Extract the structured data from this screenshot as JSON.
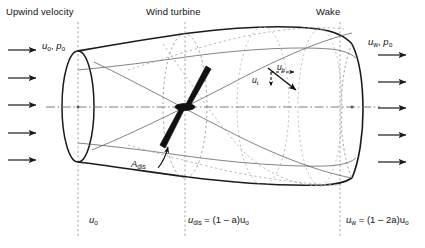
{
  "diagram": {
    "headers": [
      {
        "id": "upwind",
        "text": "Upwind velocity",
        "x": 6,
        "y": 6
      },
      {
        "id": "turbine",
        "text": "Wind turbine",
        "x": 146,
        "y": 6
      },
      {
        "id": "wake",
        "text": "Wake",
        "x": 316,
        "y": 6
      }
    ],
    "flow_labels": [
      {
        "id": "upstream-conditions",
        "u": "u",
        "usub": "o",
        "p": "p",
        "psub": "o",
        "x": 42,
        "y": 40
      },
      {
        "id": "wake-conditions",
        "u": "u",
        "usub": "w",
        "p": "p",
        "psub": "o",
        "x": 368,
        "y": 36
      }
    ],
    "vector_labels": [
      {
        "id": "u-h",
        "symbol": "u",
        "sub": "h",
        "x": 277,
        "y": 62
      },
      {
        "id": "u-t",
        "symbol": "u",
        "sub": "t",
        "x": 252,
        "y": 75
      }
    ],
    "area_label": {
      "id": "a-dis",
      "symbol": "A",
      "sub": "dis",
      "x": 131,
      "y": 158
    },
    "station_labels": [
      {
        "id": "station-upwind",
        "text": "u",
        "sub": "o",
        "expr": "",
        "x": 89,
        "y": 214
      },
      {
        "id": "station-disc",
        "text": "u",
        "sub": "dis",
        "expr": " = (1 – a)u",
        "expr_sub": "o",
        "x": 188,
        "y": 214
      },
      {
        "id": "station-wake",
        "text": "u",
        "sub": "w",
        "expr": " = (1 – 2a)u",
        "expr_sub": "o",
        "x": 346,
        "y": 214
      }
    ],
    "station_lines": [
      {
        "id": "line-upwind",
        "x": 78
      },
      {
        "id": "line-disc",
        "x": 185
      },
      {
        "id": "line-wake",
        "x": 340
      }
    ],
    "inflow_arrows": [
      {
        "id": "inflow-1",
        "y": 50
      },
      {
        "id": "inflow-2",
        "y": 78
      },
      {
        "id": "inflow-3",
        "y": 105
      },
      {
        "id": "inflow-4",
        "y": 133
      },
      {
        "id": "inflow-5",
        "y": 160
      }
    ],
    "outflow_arrows": [
      {
        "id": "outflow-1",
        "y": 55
      },
      {
        "id": "outflow-2",
        "y": 82
      },
      {
        "id": "outflow-3",
        "y": 108
      },
      {
        "id": "outflow-4",
        "y": 135
      },
      {
        "id": "outflow-5",
        "y": 162
      }
    ],
    "colors": {
      "stroke": "#1a1a1a",
      "thin_stroke": "#4a4a4a",
      "dashed": "#8a8a8a",
      "centerline": "#6e6e6e",
      "rotor": "#111111",
      "background": "#ffffff"
    }
  }
}
